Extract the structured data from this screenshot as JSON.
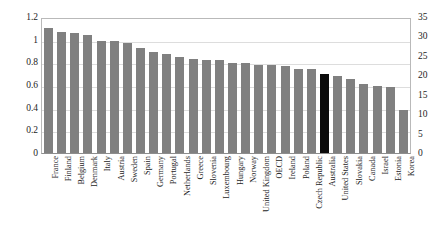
{
  "chart_data": {
    "type": "bar",
    "title": "",
    "xlabel": "",
    "ylabel": "",
    "grid": true,
    "legend": false,
    "highlight_category": "Australia",
    "highlight_color": "#0b0b0b",
    "bar_color": "#808080",
    "left_axis": {
      "ylim": [
        0,
        1.2
      ],
      "ticks": [
        "0",
        "0.2",
        "0.4",
        "0.6",
        "0.8",
        "1",
        "1.2"
      ],
      "tick_values": [
        0,
        0.2,
        0.4,
        0.6,
        0.8,
        1.0,
        1.2
      ]
    },
    "right_axis": {
      "ylim": [
        0,
        35
      ],
      "ticks": [
        "0",
        "5",
        "10",
        "15",
        "20",
        "25",
        "30",
        "35"
      ],
      "tick_values": [
        0,
        5,
        10,
        15,
        20,
        25,
        30,
        35
      ]
    },
    "categories": [
      "France",
      "Finland",
      "Belgium",
      "Denmark",
      "Italy",
      "Austria",
      "Sweden",
      "Spain",
      "Germany",
      "Portugal",
      "Netherlands",
      "Greece",
      "Slovenia",
      "Luxembourg",
      "Hungary",
      "Norway",
      "United Kingdom",
      "OECD",
      "Ireland",
      "Poland",
      "Czech Republic",
      "Australia",
      "United States",
      "Slovakia",
      "Canada",
      "Israel",
      "Estonia",
      "Korea"
    ],
    "values": [
      1.1,
      1.07,
      1.06,
      1.04,
      0.99,
      0.99,
      0.97,
      0.93,
      0.89,
      0.87,
      0.85,
      0.83,
      0.82,
      0.82,
      0.79,
      0.79,
      0.78,
      0.78,
      0.77,
      0.74,
      0.74,
      0.7,
      0.68,
      0.65,
      0.61,
      0.59,
      0.58,
      0.38
    ]
  }
}
